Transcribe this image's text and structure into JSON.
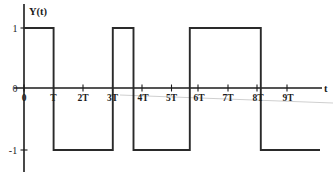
{
  "figure": {
    "background_color": "#ffffff",
    "line_color": "#2a2a2a",
    "axis_color": "#1b1b1b",
    "y_axis_label": "Y(t)",
    "x_axis_label": "t",
    "origin_label": "0"
  },
  "chart_data": {
    "type": "line",
    "title": "",
    "subtitle": "",
    "xlabel": "t",
    "ylabel": "Y(t)",
    "grid": false,
    "legend": "none",
    "xlim": [
      -0.2,
      10.2
    ],
    "ylim": [
      -1.4,
      1.4
    ],
    "xtick_labels": [
      "0",
      "T",
      "2T",
      "3T",
      "4T",
      "5T",
      "6T",
      "7T",
      "8T",
      "9T"
    ],
    "xtick_values": [
      0,
      1,
      2,
      3,
      4,
      5,
      6,
      7,
      8,
      9
    ],
    "ytick_labels": [
      "1",
      "0",
      "-1"
    ],
    "ytick_values": [
      1,
      0,
      -1
    ],
    "series": [
      {
        "name": "Y(t)",
        "waveform": "square",
        "levels": [
          1,
          -1
        ],
        "segments": [
          {
            "start_t": 0.0,
            "end_t": 1.0,
            "value": 1
          },
          {
            "start_t": 1.0,
            "end_t": 3.0,
            "value": -1
          },
          {
            "start_t": 3.0,
            "end_t": 3.7,
            "value": 1
          },
          {
            "start_t": 3.7,
            "end_t": 5.6,
            "value": -1
          },
          {
            "start_t": 5.6,
            "end_t": 8.0,
            "value": 1
          },
          {
            "start_t": 8.0,
            "end_t": 10.0,
            "value": -1
          }
        ],
        "x": [
          0.0,
          0.0,
          1.0,
          1.0,
          3.0,
          3.0,
          3.7,
          3.7,
          5.6,
          5.6,
          8.0,
          8.0,
          10.0
        ],
        "y": [
          0,
          1,
          1,
          -1,
          -1,
          1,
          1,
          -1,
          -1,
          1,
          1,
          -1,
          -1
        ]
      }
    ]
  }
}
